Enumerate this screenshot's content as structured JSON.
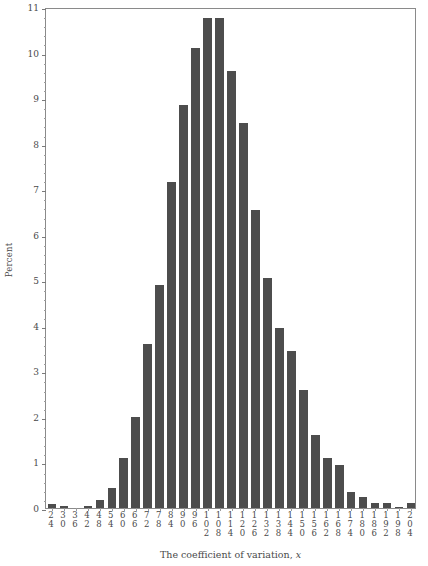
{
  "chart_data": {
    "type": "bar",
    "title": "",
    "xlabel": "The coefficient of variation, x",
    "xlabel_plain": "The coefficient of variation,",
    "xlabel_italic": "x",
    "ylabel": "Percent",
    "ylim": [
      0,
      11
    ],
    "ytick_labels": [
      "0",
      "1",
      "2",
      "3",
      "4",
      "5",
      "6",
      "7",
      "8",
      "9",
      "10",
      "11"
    ],
    "ytick_values": [
      0,
      1,
      2,
      3,
      4,
      5,
      6,
      7,
      8,
      9,
      10,
      11
    ],
    "minor_tick_step": 0.2,
    "grid": false,
    "legend": "none",
    "bar_color": "#4d4d4d",
    "axis_color": "#8a8a8a",
    "bin_width": 6,
    "categories": [
      "24",
      "30",
      "36",
      "42",
      "48",
      "54",
      "60",
      "66",
      "72",
      "78",
      "84",
      "90",
      "96",
      "102",
      "108",
      "114",
      "120",
      "126",
      "132",
      "138",
      "144",
      "150",
      "156",
      "162",
      "168",
      "174",
      "180",
      "186",
      "192",
      "198",
      "204"
    ],
    "values": [
      0.08,
      0.05,
      0.0,
      0.05,
      0.18,
      0.45,
      1.1,
      2.0,
      3.6,
      4.9,
      7.15,
      8.85,
      10.1,
      10.75,
      10.75,
      9.6,
      8.45,
      6.55,
      5.05,
      3.95,
      3.45,
      2.6,
      1.6,
      1.1,
      0.95,
      0.35,
      0.25,
      0.12,
      0.1,
      0.03,
      0.12
    ]
  }
}
